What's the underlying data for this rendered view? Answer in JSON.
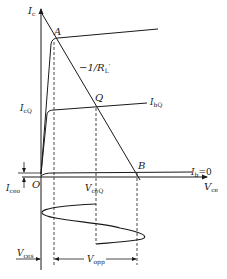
{
  "diagram": {
    "type": "transistor output characteristic with AC load line",
    "colors": {
      "line": "#1a1a1a",
      "background": "#ffffff"
    },
    "axes": {
      "y": {
        "label_main": "I",
        "label_sub": "c"
      },
      "x": {
        "label_main": "V",
        "label_sub": "ce"
      },
      "origin": "O"
    },
    "points": {
      "A": "A",
      "Q": "Q",
      "B": "B"
    },
    "load_line_label": {
      "text": "−1/R",
      "sub": "L",
      "prime": "′"
    },
    "curves": {
      "ibq": {
        "main": "I",
        "sub": "bQ"
      },
      "ib0": {
        "main": "I",
        "sub": "b",
        "suffix": "=0"
      }
    },
    "y_labels": {
      "icq": {
        "main": "I",
        "sub": "cQ"
      },
      "iceo": {
        "main": "I",
        "sub": "ceo"
      }
    },
    "x_labels": {
      "vceq": {
        "main": "V",
        "sub": "ceQ"
      }
    },
    "bottom_labels": {
      "vces": {
        "main": "V",
        "sub": "ces"
      },
      "vopp": {
        "main": "V",
        "sub": "opp"
      }
    }
  }
}
